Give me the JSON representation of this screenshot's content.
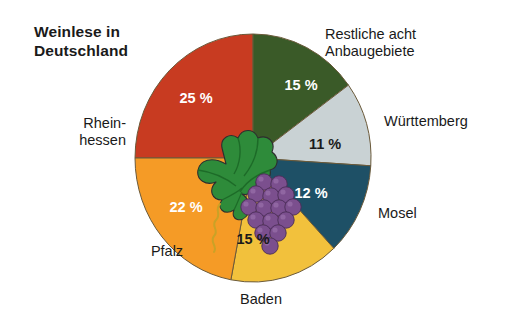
{
  "chart": {
    "title": "Weinlese in\nDeutschland",
    "decoration": "grapes-and-vine-leaves-illustration"
  },
  "chart_data": {
    "type": "pie",
    "title": "Weinlese in Deutschland",
    "subtitle": "",
    "xlabel": "",
    "ylabel": "",
    "unit": "%",
    "legend_position": "outside-labels",
    "grid": false,
    "categories": [
      "Rheinhessen",
      "Restliche acht Anbaugebiete",
      "Württemberg",
      "Mosel",
      "Baden",
      "Pfalz"
    ],
    "values": [
      25,
      15,
      11,
      12,
      15,
      22
    ],
    "value_labels": [
      "25 %",
      "15 %",
      "11 %",
      "12 %",
      "15 %",
      "22 %"
    ],
    "colors": [
      "#C83B21",
      "#3A5A28",
      "#C9D2D4",
      "#1E5066",
      "#F2C13C",
      "#F59B26"
    ],
    "slices": [
      {
        "name": "Rheinhessen",
        "label": "Rhein-\nhessen",
        "value": 25,
        "value_label": "25 %",
        "color": "#C83B21",
        "value_text_color": "#ffffff",
        "start_angle": 270,
        "end_angle": 360,
        "label_x": 126,
        "label_y": 115,
        "label_align": "left",
        "value_x": 196,
        "value_y": 98
      },
      {
        "name": "Restliche acht Anbaugebiete",
        "label": "Restliche acht\nAnbaugebiete",
        "value": 15,
        "value_label": "15 %",
        "color": "#3A5A28",
        "value_text_color": "#ffffff",
        "start_angle": 0,
        "end_angle": 54,
        "label_x": 325,
        "label_y": 26,
        "label_align": "right",
        "value_x": 301,
        "value_y": 85
      },
      {
        "name": "Württemberg",
        "label": "Württemberg",
        "value": 11,
        "value_label": "11 %",
        "color": "#C9D2D4",
        "value_text_color": "#1a1a1a",
        "start_angle": 54,
        "end_angle": 93.6,
        "label_x": 384,
        "label_y": 113,
        "label_align": "right",
        "value_x": 325,
        "value_y": 144
      },
      {
        "name": "Mosel",
        "label": "Mosel",
        "value": 12,
        "value_label": "12 %",
        "color": "#1E5066",
        "value_text_color": "#ffffff",
        "start_angle": 93.6,
        "end_angle": 136.8,
        "label_x": 378,
        "label_y": 205,
        "label_align": "right",
        "value_x": 311,
        "value_y": 193
      },
      {
        "name": "Baden",
        "label": "Baden",
        "value": 15,
        "value_label": "15 %",
        "color": "#F2C13C",
        "value_text_color": "#1a1a1a",
        "start_angle": 136.8,
        "end_angle": 190.8,
        "label_x": 261,
        "label_y": 291,
        "label_align": "center",
        "value_x": 253,
        "value_y": 239
      },
      {
        "name": "Pfalz",
        "label": "Pfalz",
        "value": 22,
        "value_label": "22 %",
        "color": "#F59B26",
        "value_text_color": "#ffffff",
        "start_angle": 190.8,
        "end_angle": 270,
        "label_x": 167,
        "label_y": 243,
        "label_align": "center",
        "value_x": 186,
        "value_y": 207
      }
    ]
  }
}
